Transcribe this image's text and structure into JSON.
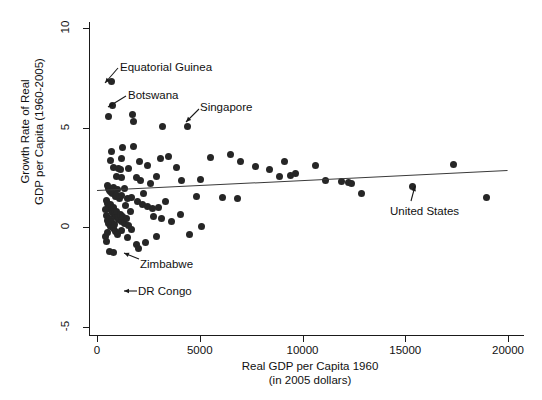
{
  "chart_data": {
    "type": "scatter",
    "title": "",
    "xlabel": "Real GDP per Capita 1960",
    "xlabel_line2": "(in 2005 dollars)",
    "ylabel": "Growth Rate of Real",
    "ylabel_line2": "GDP per Capita (1960-2005)",
    "xlim": [
      0,
      20000
    ],
    "ylim": [
      -5,
      10
    ],
    "xticks": [
      0,
      5000,
      10000,
      15000,
      20000
    ],
    "xtick_labels": [
      "0",
      "5000",
      "10000",
      "15000",
      "20000"
    ],
    "yticks": [
      -5,
      0,
      5,
      10
    ],
    "ytick_labels": [
      "-5",
      "0",
      "5",
      "10"
    ],
    "grid": false,
    "legend": false,
    "marker_color": "#262626",
    "fit_line_color": "#3a3a3a",
    "fit_line": {
      "x0": 0,
      "y0": 1.85,
      "x1": 20000,
      "y1": 2.85
    },
    "points": [
      [
        700,
        7.3
      ],
      [
        750,
        6.1
      ],
      [
        570,
        5.55
      ],
      [
        1720,
        5.65
      ],
      [
        1760,
        5.3
      ],
      [
        4400,
        5.05
      ],
      [
        3170,
        5.05
      ],
      [
        1240,
        4.0
      ],
      [
        1760,
        4.05
      ],
      [
        1200,
        3.45
      ],
      [
        700,
        3.8
      ],
      [
        680,
        3.35
      ],
      [
        820,
        3.0
      ],
      [
        1060,
        2.95
      ],
      [
        1130,
        2.9
      ],
      [
        940,
        2.55
      ],
      [
        1210,
        2.5
      ],
      [
        1900,
        2.5
      ],
      [
        2130,
        2.35
      ],
      [
        2480,
        3.1
      ],
      [
        2880,
        2.55
      ],
      [
        3070,
        3.45
      ],
      [
        3500,
        3.55
      ],
      [
        3860,
        3.0
      ],
      [
        4120,
        2.35
      ],
      [
        5050,
        2.4
      ],
      [
        5500,
        3.5
      ],
      [
        6500,
        3.65
      ],
      [
        7000,
        3.3
      ],
      [
        7700,
        3.05
      ],
      [
        8400,
        2.9
      ],
      [
        9100,
        3.3
      ],
      [
        8900,
        2.55
      ],
      [
        9400,
        2.6
      ],
      [
        9650,
        2.7
      ],
      [
        10650,
        3.1
      ],
      [
        11100,
        2.35
      ],
      [
        11900,
        2.3
      ],
      [
        12250,
        2.25
      ],
      [
        12400,
        2.2
      ],
      [
        12850,
        1.7
      ],
      [
        15350,
        2.05
      ],
      [
        17350,
        3.15
      ],
      [
        18950,
        1.5
      ],
      [
        520,
        2.1
      ],
      [
        560,
        1.95
      ],
      [
        600,
        1.85
      ],
      [
        640,
        1.8
      ],
      [
        700,
        1.75
      ],
      [
        760,
        1.7
      ],
      [
        820,
        2.0
      ],
      [
        880,
        1.55
      ],
      [
        950,
        1.6
      ],
      [
        1020,
        1.9
      ],
      [
        1100,
        1.45
      ],
      [
        1180,
        1.6
      ],
      [
        1330,
        1.95
      ],
      [
        1480,
        1.45
      ],
      [
        1700,
        1.5
      ],
      [
        1960,
        1.3
      ],
      [
        2200,
        1.15
      ],
      [
        2450,
        1.05
      ],
      [
        2720,
        0.95
      ],
      [
        3000,
        1.0
      ],
      [
        3350,
        1.3
      ],
      [
        480,
        1.35
      ],
      [
        520,
        1.2
      ],
      [
        560,
        1.05
      ],
      [
        600,
        0.95
      ],
      [
        640,
        1.15
      ],
      [
        690,
        0.85
      ],
      [
        740,
        0.75
      ],
      [
        790,
        1.0
      ],
      [
        840,
        0.65
      ],
      [
        890,
        0.55
      ],
      [
        940,
        0.8
      ],
      [
        1000,
        0.5
      ],
      [
        1060,
        0.4
      ],
      [
        1120,
        0.65
      ],
      [
        1180,
        0.3
      ],
      [
        1250,
        0.55
      ],
      [
        1330,
        0.2
      ],
      [
        1420,
        0.45
      ],
      [
        1520,
        0.1
      ],
      [
        430,
        0.9
      ],
      [
        470,
        0.6
      ],
      [
        510,
        0.35
      ],
      [
        560,
        0.2
      ],
      [
        610,
        0.45
      ],
      [
        660,
        0.05
      ],
      [
        720,
        0.3
      ],
      [
        780,
        -0.05
      ],
      [
        850,
        0.15
      ],
      [
        920,
        -0.2
      ],
      [
        1000,
        -0.35
      ],
      [
        1200,
        -0.15
      ],
      [
        1480,
        -0.5
      ],
      [
        1680,
        -0.1
      ],
      [
        1900,
        -0.85
      ],
      [
        2020,
        -1.05
      ],
      [
        2380,
        -0.75
      ],
      [
        410,
        -0.45
      ],
      [
        450,
        -0.7
      ],
      [
        500,
        -0.25
      ],
      [
        620,
        -1.2
      ],
      [
        780,
        -1.25
      ],
      [
        2740,
        0.55
      ],
      [
        3150,
        0.45
      ],
      [
        3620,
        0.3
      ],
      [
        4050,
        0.65
      ],
      [
        4500,
        -0.35
      ],
      [
        5100,
        0.05
      ],
      [
        2900,
        -0.45
      ],
      [
        2280,
        1.7
      ],
      [
        4850,
        1.55
      ],
      [
        6100,
        1.5
      ],
      [
        6850,
        1.45
      ],
      [
        1550,
        2.95
      ],
      [
        2050,
        3.3
      ],
      [
        2600,
        2.2
      ],
      [
        1380,
        1.1
      ],
      [
        1620,
        0.8
      ]
    ],
    "annotations": [
      {
        "name": "equatorial-guinea",
        "label": "Equatorial Guinea",
        "point": [
          700,
          7.3
        ],
        "label_pos": [
          120,
          61
        ],
        "arrow": {
          "x1": 118,
          "y1": 68,
          "x2": 105,
          "y2": 83
        }
      },
      {
        "name": "botswana",
        "label": "Botswana",
        "point": [
          750,
          6.1
        ],
        "label_pos": [
          128,
          89
        ],
        "arrow": {
          "x1": 126,
          "y1": 96,
          "x2": 108,
          "y2": 107
        }
      },
      {
        "name": "singapore",
        "label": "Singapore",
        "point": [
          4400,
          5.05
        ],
        "label_pos": [
          200,
          101
        ],
        "arrow": {
          "x1": 199,
          "y1": 109,
          "x2": 186,
          "y2": 122
        }
      },
      {
        "name": "united-states",
        "label": "United States",
        "point": [
          15350,
          2.05
        ],
        "label_pos": [
          390,
          205
        ],
        "arrow": {
          "x1": 411,
          "y1": 201,
          "x2": 415,
          "y2": 186
        }
      },
      {
        "name": "zimbabwe",
        "label": "Zimbabwe",
        "point": [
          1150,
          -1.7
        ],
        "label_pos": [
          140,
          258
        ],
        "arrow": {
          "x1": 139,
          "y1": 259,
          "x2": 124,
          "y2": 253
        }
      },
      {
        "name": "dr-congo",
        "label": "DR Congo",
        "point": [
          1100,
          -3.6
        ],
        "label_pos": [
          138,
          285
        ],
        "arrow": {
          "x1": 137,
          "y1": 291,
          "x2": 124,
          "y2": 291
        }
      }
    ]
  }
}
